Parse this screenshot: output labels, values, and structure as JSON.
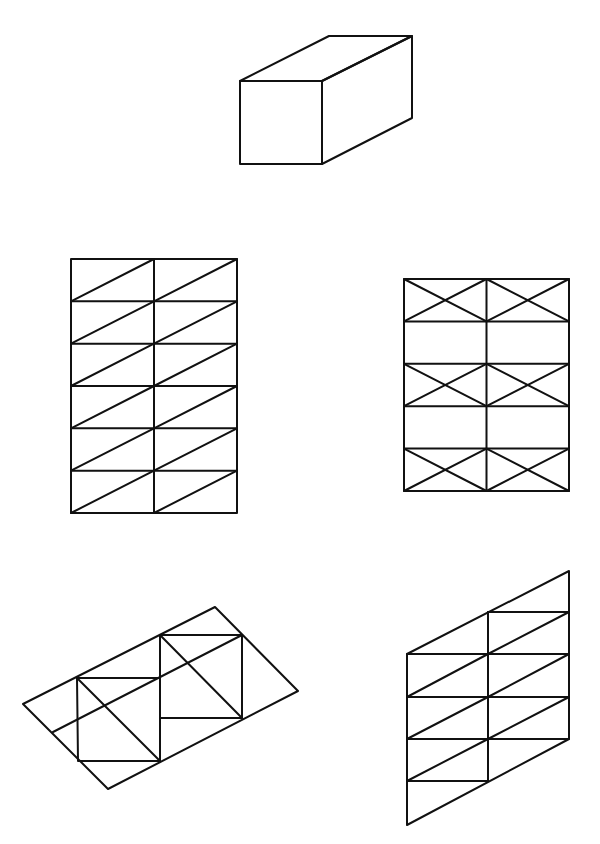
{
  "canvas": {
    "width": 600,
    "height": 844,
    "background": "#ffffff",
    "stroke": "#111111",
    "stroke_width": 2
  },
  "figures": [
    {
      "id": "box",
      "name": "rectangular-prism",
      "description": "Oblique drawing of a rectangular box",
      "polygons": [
        [
          [
            240,
            81
          ],
          [
            322,
            81
          ],
          [
            322,
            164
          ],
          [
            240,
            164
          ]
        ],
        [
          [
            240,
            81
          ],
          [
            329,
            36
          ],
          [
            412,
            36
          ],
          [
            322,
            81
          ]
        ],
        [
          [
            322,
            81
          ],
          [
            412,
            36
          ],
          [
            412,
            118
          ],
          [
            322,
            164
          ]
        ]
      ],
      "lines": []
    },
    {
      "id": "grid-diagonal-braced",
      "name": "fully-braced-grid",
      "description": "2 columns x 6 rows grid, every cell braced with one diagonal",
      "grid": {
        "x0": 71,
        "x1": 237,
        "y0": 259,
        "y1": 513,
        "cols": 2,
        "rows": 6,
        "bracing": "diagonal-all"
      }
    },
    {
      "id": "grid-x-braced",
      "name": "alternate-x-braced-grid",
      "description": "2 columns x 5 rows grid, rows 1, 3 and 5 have X-bracing",
      "grid": {
        "x0": 404,
        "x1": 569,
        "y0": 279,
        "y1": 491,
        "cols": 2,
        "rows": 5,
        "bracing": "x-alternate",
        "braced_rows": [
          0,
          2,
          4
        ]
      }
    },
    {
      "id": "tilted-frame",
      "name": "tilted-braced-frame",
      "description": "Rotated parallelogram containing two offset braced squares",
      "polygons": [
        [
          [
            23,
            704
          ],
          [
            215,
            607
          ],
          [
            298,
            691
          ],
          [
            108,
            789
          ]
        ],
        [
          [
            77,
            678
          ],
          [
            160,
            678
          ],
          [
            160,
            761
          ],
          [
            78,
            761
          ]
        ],
        [
          [
            160,
            635
          ],
          [
            242,
            635
          ],
          [
            242,
            718
          ],
          [
            160,
            718
          ]
        ]
      ],
      "lines": [
        [
          [
            53,
            732
          ],
          [
            242,
            635
          ]
        ],
        [
          [
            77,
            678
          ],
          [
            160,
            761
          ]
        ],
        [
          [
            160,
            635
          ],
          [
            242,
            718
          ]
        ],
        [
          [
            160,
            678
          ],
          [
            160,
            718
          ]
        ]
      ]
    },
    {
      "id": "sheared-grid",
      "name": "sheared-braced-frame",
      "description": "Parallelogram frame with staggered rows and diagonal bracing",
      "polygons": [
        [
          [
            407,
            654
          ],
          [
            569,
            571
          ],
          [
            569,
            739
          ],
          [
            407,
            825
          ]
        ]
      ],
      "lines": [
        [
          [
            488,
            612
          ],
          [
            488,
            781
          ]
        ],
        [
          [
            488,
            612
          ],
          [
            569,
            612
          ]
        ],
        [
          [
            407,
            654
          ],
          [
            569,
            654
          ]
        ],
        [
          [
            407,
            697
          ],
          [
            569,
            697
          ]
        ],
        [
          [
            407,
            739
          ],
          [
            569,
            739
          ]
        ],
        [
          [
            407,
            781
          ],
          [
            488,
            781
          ]
        ],
        [
          [
            488,
            654
          ],
          [
            569,
            612
          ]
        ],
        [
          [
            488,
            697
          ],
          [
            569,
            654
          ]
        ],
        [
          [
            488,
            739
          ],
          [
            569,
            697
          ]
        ],
        [
          [
            407,
            697
          ],
          [
            488,
            654
          ]
        ],
        [
          [
            407,
            739
          ],
          [
            488,
            697
          ]
        ],
        [
          [
            407,
            781
          ],
          [
            488,
            739
          ]
        ]
      ]
    }
  ]
}
